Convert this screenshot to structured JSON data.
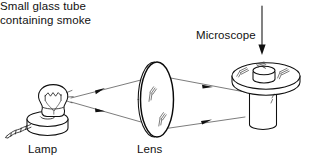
{
  "figure": {
    "kind": "physics-apparatus-diagram",
    "width": 316,
    "height": 167,
    "background_color": "#ffffff",
    "ink_color": "#101010"
  },
  "labels": {
    "lamp": "Lamp",
    "lens": "Lens",
    "microscope": "Microscope",
    "tube_line1": "Small glass tube",
    "tube_line2": "containing smoke"
  },
  "components": {
    "lamp": {
      "name": "Lamp",
      "parts": [
        "bulb",
        "filament",
        "bulb-neck",
        "round-base",
        "power-cord"
      ]
    },
    "lens": {
      "name": "Lens",
      "parts": [
        "convex-lens-ellipse",
        "lens-rim",
        "glass-highlight-marks"
      ]
    },
    "smoke_cell": {
      "name": "Small glass tube containing smoke",
      "parts": [
        "flat-disc-plate",
        "vertical-glass-tube",
        "glass-highlight-marks"
      ]
    },
    "microscope": {
      "name": "Microscope",
      "parts": [
        "downward-arrow"
      ],
      "arrow_direction": "down"
    }
  },
  "light_rays": {
    "count": 4,
    "description": "Two diverging rays from lamp to lens and two converging rays from lens to smoke tube",
    "arrowheads": 4,
    "segments": [
      {
        "id": "lamp-to-lens-upper",
        "from": "lamp",
        "to": "lens",
        "arrow": true
      },
      {
        "id": "lamp-to-lens-lower",
        "from": "lamp",
        "to": "lens",
        "arrow": true
      },
      {
        "id": "lens-to-tube-upper",
        "from": "lens",
        "to": "smoke_cell",
        "arrow": true
      },
      {
        "id": "lens-to-tube-lower",
        "from": "lens",
        "to": "smoke_cell",
        "arrow": true
      }
    ]
  }
}
